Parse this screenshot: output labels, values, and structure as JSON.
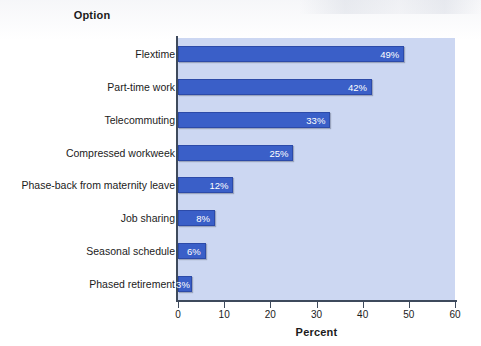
{
  "chart_data": {
    "type": "bar",
    "orientation": "horizontal",
    "title": "",
    "xlabel": "Percent",
    "ylabel": "Option",
    "xlim": [
      0,
      60
    ],
    "xticks": [
      0,
      10,
      20,
      30,
      40,
      50,
      60
    ],
    "xtick_labels": [
      "0",
      "10",
      "20",
      "30",
      "40",
      "50",
      "60"
    ],
    "grid": false,
    "legend": "none",
    "categories": [
      "Flextime",
      "Part-time work",
      "Telecommuting",
      "Compressed workweek",
      "Phase-back from maternity leave",
      "Job sharing",
      "Seasonal schedule",
      "Phased retirement"
    ],
    "values": [
      49,
      42,
      33,
      25,
      12,
      8,
      6,
      3
    ],
    "value_labels": [
      "49%",
      "42%",
      "33%",
      "25%",
      "12%",
      "8%",
      "6%",
      "3%"
    ],
    "bars": [
      {
        "label": "Flextime",
        "value": 49,
        "value_label": "49%"
      },
      {
        "label": "Part-time work",
        "value": 42,
        "value_label": "42%"
      },
      {
        "label": "Telecommuting",
        "value": 33,
        "value_label": "33%"
      },
      {
        "label": "Compressed workweek",
        "value": 25,
        "value_label": "25%"
      },
      {
        "label": "Phase-back from maternity leave",
        "value": 12,
        "value_label": "12%"
      },
      {
        "label": "Job sharing",
        "value": 8,
        "value_label": "8%"
      },
      {
        "label": "Seasonal schedule",
        "value": 6,
        "value_label": "6%"
      },
      {
        "label": "Phased retirement",
        "value": 3,
        "value_label": "3%"
      }
    ],
    "colors": {
      "bar_fill": "#3a5fc8",
      "bar_border": "#2c4aa8",
      "plot_background": "#ccd7f2",
      "axis_line": "#3e4a5c",
      "value_label_text": "#ffffff",
      "text": "#1b1b1b",
      "page_background": "#ffffff"
    }
  }
}
